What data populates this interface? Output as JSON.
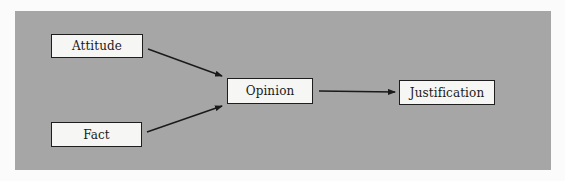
{
  "diagram": {
    "type": "flow",
    "colors": {
      "page_background": "#fbfbfb",
      "panel_background": "#a6a6a6",
      "node_fill": "#f6f6f4",
      "node_border": "#1e1e1e",
      "arrow": "#1a1a1a"
    },
    "nodes": [
      {
        "id": "attitude",
        "label": "Attitude"
      },
      {
        "id": "fact",
        "label": "Fact"
      },
      {
        "id": "opinion",
        "label": "Opinion"
      },
      {
        "id": "justification",
        "label": "Justification"
      }
    ],
    "edges": [
      {
        "from": "attitude",
        "to": "opinion"
      },
      {
        "from": "fact",
        "to": "opinion"
      },
      {
        "from": "opinion",
        "to": "justification"
      }
    ]
  }
}
